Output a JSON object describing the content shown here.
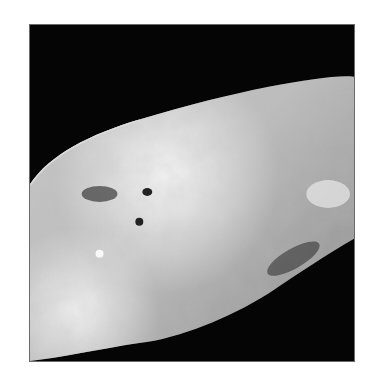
{
  "image": {
    "subject": "grayscale photograph of an irregular rocky celestial body",
    "background_color": "#050505",
    "border_color": "#6a6a6a",
    "surface_tones": [
      "#f2f2f2",
      "#cfcfcf",
      "#a8a8a8",
      "#6f6f6f",
      "#2a2a2a"
    ]
  }
}
